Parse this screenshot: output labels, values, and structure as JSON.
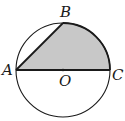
{
  "diagram": {
    "type": "geometry",
    "points": {
      "A": {
        "label": "A",
        "x": 16,
        "y": 70
      },
      "B": {
        "label": "B",
        "x": 63,
        "y": 24
      },
      "C": {
        "label": "C",
        "x": 110,
        "y": 70
      },
      "O": {
        "label": "O",
        "x": 63,
        "y": 70
      }
    },
    "circle": {
      "cx": 63,
      "cy": 70,
      "r": 47
    },
    "colors": {
      "stroke": "#1a1a1a",
      "shade": "#c8c8c8",
      "background": "#ffffff"
    }
  }
}
